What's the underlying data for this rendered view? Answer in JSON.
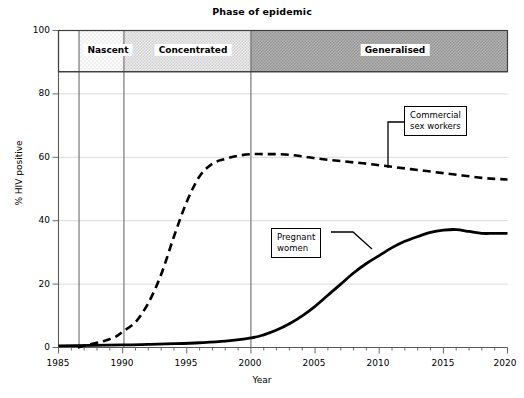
{
  "chart_data": {
    "type": "line",
    "title": "Phase of epidemic",
    "xlabel": "Year",
    "ylabel": "% HIV positive",
    "xlim": [
      1985,
      2020
    ],
    "ylim": [
      0,
      100
    ],
    "xticks": [
      1985,
      1990,
      1995,
      2000,
      2005,
      2010,
      2015,
      2020
    ],
    "yticks": [
      0,
      20,
      40,
      60,
      80,
      100
    ],
    "minor_x_tick_interval": 1,
    "grid": "horizontal-only",
    "legend_position": "inline-callouts",
    "series": [
      {
        "name": "Commercial sex workers",
        "style": "dashed",
        "x": [
          1986.5,
          1987.5,
          1988.5,
          1989.5,
          1990,
          1991,
          1992,
          1993,
          1994,
          1995,
          1996,
          1997,
          1998,
          1999,
          2000,
          2001,
          2002,
          2003,
          2004,
          2005,
          2006,
          2007,
          2008,
          2009,
          2010,
          2011,
          2012,
          2013,
          2014,
          2015,
          2016,
          2017,
          2018,
          2019,
          2020
        ],
        "values": [
          0,
          1,
          2,
          3.5,
          5,
          8,
          14,
          23,
          35,
          46,
          54,
          58,
          59.5,
          60.5,
          61,
          61,
          61,
          60.8,
          60.3,
          59.7,
          59.2,
          58.8,
          58.4,
          58,
          57.5,
          57,
          56.5,
          56,
          55.5,
          55,
          54.5,
          54,
          53.5,
          53.2,
          53
        ]
      },
      {
        "name": "Pregnant women",
        "style": "solid",
        "x": [
          1985,
          1990,
          1992,
          1994,
          1996,
          1998,
          2000,
          2001,
          2002,
          2003,
          2004,
          2005,
          2006,
          2007,
          2008,
          2009,
          2010,
          2011,
          2012,
          2013,
          2014,
          2015,
          2016,
          2017,
          2018,
          2019,
          2020
        ],
        "values": [
          0.5,
          0.8,
          1,
          1.2,
          1.5,
          2,
          3,
          4,
          5.5,
          7.5,
          10,
          13,
          16.5,
          20,
          23.5,
          26.5,
          29,
          31.5,
          33.5,
          35,
          36.3,
          37,
          37.2,
          36.6,
          36,
          36,
          36
        ]
      }
    ],
    "bands": [
      {
        "label": "",
        "start": 1985,
        "end": 1986.6,
        "fill": "#ffffff"
      },
      {
        "label": "Nascent",
        "start": 1986.6,
        "end": 1990.1,
        "fill": "#f2f2f2"
      },
      {
        "label": "Concentrated",
        "start": 1990.1,
        "end": 2000.0,
        "fill": "#e0e0e0"
      },
      {
        "label": "Generalised",
        "start": 2000.0,
        "end": 2020,
        "fill": "#b5b5b5"
      }
    ],
    "band_top": 100,
    "band_bottom": 87,
    "annotations": [
      {
        "name": "Commercial sex workers",
        "text_line1": "Commercial",
        "text_line2": "sex workers",
        "box_x": 404,
        "box_y": 106,
        "leader_points": "388,168 388,122 404,122"
      },
      {
        "name": "Pregnant women",
        "text_line1": "Pregnant",
        "text_line2": "women",
        "box_x": 271,
        "box_y": 228,
        "leader_points": "331,232 353,232 372,249"
      }
    ],
    "colors": {
      "series_line": "#000000",
      "gridline": "#d9d9d9",
      "axis": "#595959",
      "band_nascent": "#f2f2f2",
      "band_concentrated": "#e0e0e0",
      "band_generalised": "#b5b5b5"
    }
  },
  "axes": {
    "y_tick_labels": [
      "100",
      "80",
      "60",
      "40",
      "20",
      "0"
    ],
    "x_tick_labels": [
      "1985",
      "1990",
      "1995",
      "2000",
      "2005",
      "2010",
      "2015",
      "2020"
    ]
  }
}
